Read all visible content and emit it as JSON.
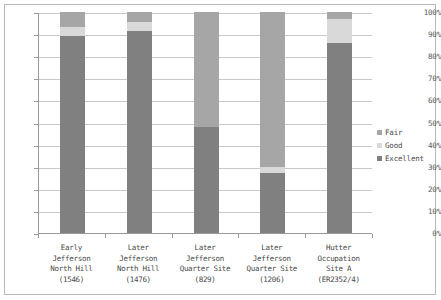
{
  "chart_data": {
    "type": "bar",
    "subtype": "stacked-percent",
    "title": "",
    "xlabel": "",
    "ylabel": "",
    "ylim": [
      0,
      100
    ],
    "y_tick_labels": [
      "100%",
      "90%",
      "80%",
      "70%",
      "60%",
      "50%",
      "40%",
      "30%",
      "20%",
      "10%",
      "0%"
    ],
    "y_tick_values": [
      100,
      90,
      80,
      70,
      60,
      50,
      40,
      30,
      20,
      10,
      0
    ],
    "grid": true,
    "grid_axis": "y",
    "legend_position": "right",
    "categories": [
      "Early\nJefferson\nNorth Hill\n(1546)",
      "Later\nJefferson\nNorth Hill\n(1476)",
      "Later\nJefferson\nQuarter Site\n(829)",
      "Later\nJefferson\nQuarter Site\n(1206)",
      "Hutter\nOccupation\nSite A\n(ER2352/4)"
    ],
    "category_counts": [
      "1546",
      "1476",
      "829",
      "1206",
      "ER2352/4"
    ],
    "series": [
      {
        "name": "Excellent",
        "color": "#808080",
        "values": [
          89,
          91.5,
          48,
          27,
          86
        ]
      },
      {
        "name": "Good",
        "color": "#d9d9d9",
        "values": [
          4,
          4,
          0,
          3,
          11
        ]
      },
      {
        "name": "Fair",
        "color": "#a6a6a6",
        "values": [
          7,
          4.5,
          52,
          70,
          3
        ]
      }
    ],
    "stack_order_bottom_to_top": [
      "Excellent",
      "Good",
      "Fair"
    ],
    "legend_entries": [
      {
        "label": "Fair",
        "color": "#a6a6a6"
      },
      {
        "label": "Good",
        "color": "#d9d9d9"
      },
      {
        "label": "Excellent",
        "color": "#808080"
      }
    ]
  },
  "colors": {
    "excellent": "#808080",
    "good": "#d9d9d9",
    "fair": "#a6a6a6",
    "gridline": "#c8c8c8",
    "axis": "#9a9a9a",
    "frame": "#b9b9b9",
    "text": "#4a4a4a",
    "background": "#ffffff"
  }
}
